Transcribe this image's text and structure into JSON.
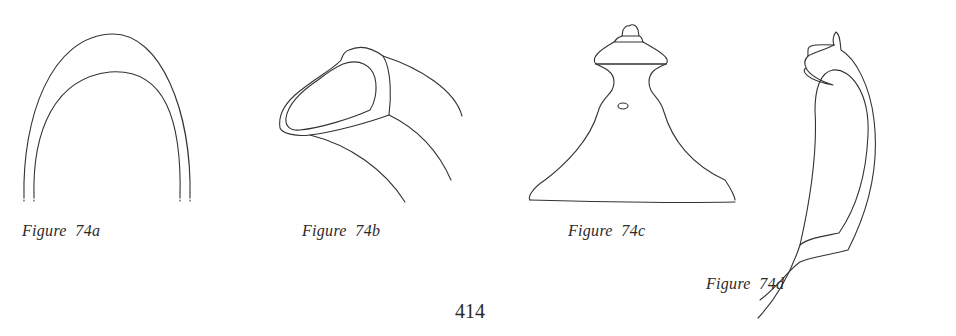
{
  "page": {
    "number": "414"
  },
  "figures": [
    {
      "id": "74a",
      "caption": "Figure  74a"
    },
    {
      "id": "74b",
      "caption": "Figure  74b"
    },
    {
      "id": "74c",
      "caption": "Figure  74c"
    },
    {
      "id": "74d",
      "caption": "Figure  74d"
    }
  ]
}
